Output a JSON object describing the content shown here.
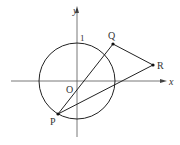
{
  "diagram": {
    "type": "geometry",
    "axes": {
      "x_label": "x",
      "y_label": "y",
      "origin_label": "O",
      "unit_label": "1"
    },
    "circle": {
      "description": "unit circle centered at origin",
      "radius": 1
    },
    "points": [
      {
        "name": "P",
        "position": "on circle, lower-left"
      },
      {
        "name": "Q",
        "position": "upper right, outside circle"
      },
      {
        "name": "R",
        "position": "right, above x-axis"
      }
    ],
    "segments": [
      "PQ",
      "QR",
      "RP"
    ],
    "labels": {
      "P": "P",
      "Q": "Q",
      "R": "R"
    },
    "colors": {
      "stroke": "#222222",
      "axis": "#444444",
      "background": "#ffffff"
    }
  }
}
